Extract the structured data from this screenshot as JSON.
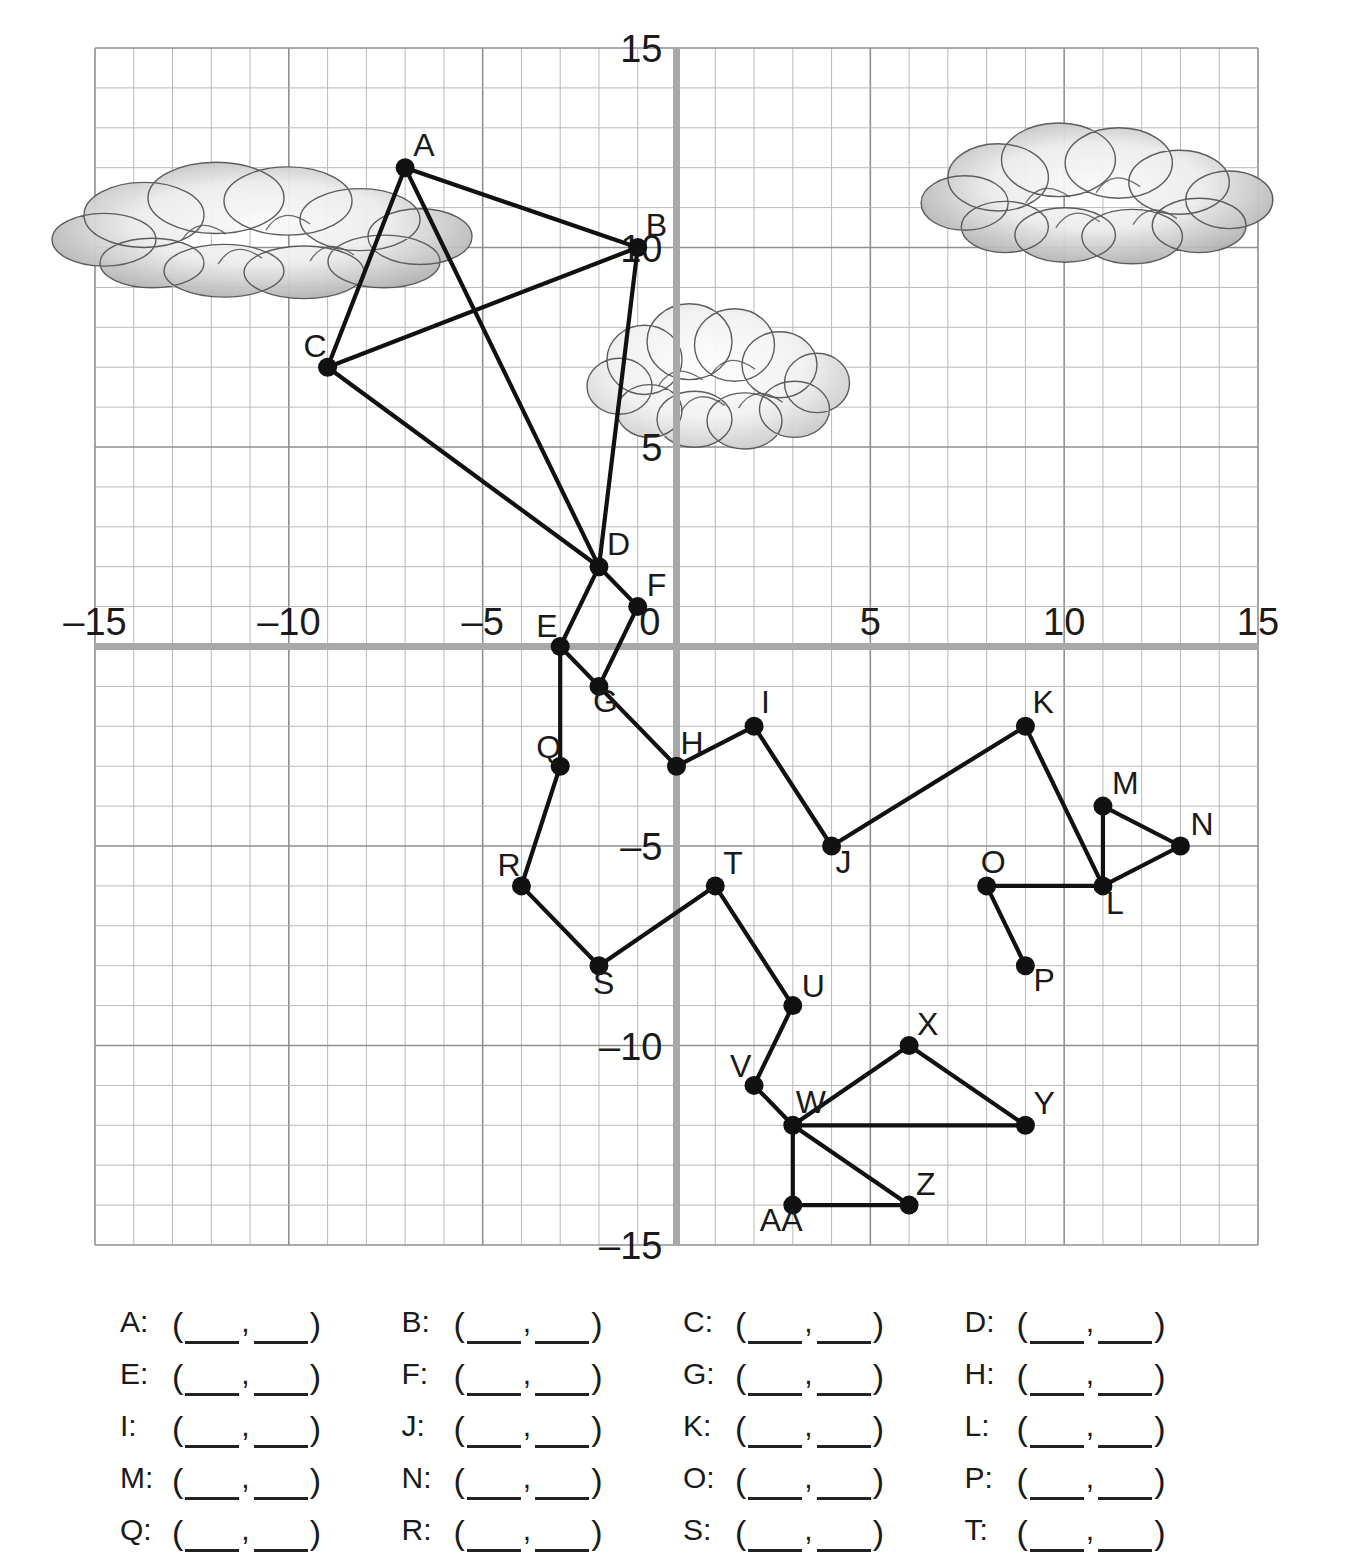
{
  "chart_data": {
    "type": "scatter",
    "title": "",
    "xlabel": "",
    "ylabel": "",
    "xlim": [
      -15,
      15
    ],
    "ylim": [
      -15,
      15
    ],
    "grid": true,
    "grid_step": 1,
    "major_step": 5,
    "x_ticks": [
      -15,
      -10,
      -5,
      0,
      5,
      10,
      15
    ],
    "y_ticks": [
      -15,
      -10,
      -5,
      5,
      10,
      15
    ],
    "x_tick_labels": [
      "–15",
      "–10",
      "–5",
      "0",
      "5",
      "10",
      "15"
    ],
    "y_tick_labels": [
      "–15",
      "–10",
      "–5",
      "5",
      "10",
      "15"
    ],
    "origin_label": "0",
    "points": [
      {
        "label": "A",
        "x": -7,
        "y": 12,
        "lx": 8,
        "ly": -12
      },
      {
        "label": "B",
        "x": -1,
        "y": 10,
        "lx": 8,
        "ly": -12
      },
      {
        "label": "C",
        "x": -9,
        "y": 7,
        "lx": -24,
        "ly": -10
      },
      {
        "label": "D",
        "x": -2,
        "y": 2,
        "lx": 8,
        "ly": -12
      },
      {
        "label": "E",
        "x": -3,
        "y": 0,
        "lx": -24,
        "ly": -10
      },
      {
        "label": "F",
        "x": -1,
        "y": 1,
        "lx": 9,
        "ly": -11
      },
      {
        "label": "G",
        "x": -2,
        "y": -1,
        "lx": -6,
        "ly": 26
      },
      {
        "label": "H",
        "x": 0,
        "y": -3,
        "lx": 4,
        "ly": -12
      },
      {
        "label": "I",
        "x": 2,
        "y": -2,
        "lx": 7,
        "ly": -13
      },
      {
        "label": "J",
        "x": 4,
        "y": -5,
        "lx": 4,
        "ly": 27
      },
      {
        "label": "K",
        "x": 9,
        "y": -2,
        "lx": 7,
        "ly": -13
      },
      {
        "label": "L",
        "x": 11,
        "y": -6,
        "lx": 3,
        "ly": 28
      },
      {
        "label": "M",
        "x": 11,
        "y": -4,
        "lx": 9,
        "ly": -12
      },
      {
        "label": "N",
        "x": 13,
        "y": -5,
        "lx": 10,
        "ly": -11
      },
      {
        "label": "O",
        "x": 8,
        "y": -6,
        "lx": -6,
        "ly": -13
      },
      {
        "label": "P",
        "x": 9,
        "y": -8,
        "lx": 8,
        "ly": 25
      },
      {
        "label": "Q",
        "x": -3,
        "y": -3,
        "lx": -24,
        "ly": -8
      },
      {
        "label": "R",
        "x": -4,
        "y": -6,
        "lx": -24,
        "ly": -10
      },
      {
        "label": "S",
        "x": -2,
        "y": -8,
        "lx": -6,
        "ly": 28
      },
      {
        "label": "T",
        "x": 1,
        "y": -6,
        "lx": 8,
        "ly": -12
      },
      {
        "label": "U",
        "x": 3,
        "y": -9,
        "lx": 9,
        "ly": -9
      },
      {
        "label": "V",
        "x": 2,
        "y": -11,
        "lx": -24,
        "ly": -8
      },
      {
        "label": "W",
        "x": 3,
        "y": -12,
        "lx": 3,
        "ly": -12
      },
      {
        "label": "X",
        "x": 6,
        "y": -10,
        "lx": 8,
        "ly": -11
      },
      {
        "label": "Y",
        "x": 9,
        "y": -12,
        "lx": 8,
        "ly": -11
      },
      {
        "label": "Z",
        "x": 6,
        "y": -14,
        "lx": 7,
        "ly": -10
      },
      {
        "label": "AA",
        "x": 3,
        "y": -14,
        "lx": -33,
        "ly": 26
      }
    ],
    "segments": [
      [
        "A",
        "B"
      ],
      [
        "A",
        "C"
      ],
      [
        "A",
        "D"
      ],
      [
        "B",
        "C"
      ],
      [
        "B",
        "D"
      ],
      [
        "C",
        "D"
      ],
      [
        "D",
        "E"
      ],
      [
        "D",
        "F"
      ],
      [
        "E",
        "G"
      ],
      [
        "E",
        "Q"
      ],
      [
        "F",
        "G"
      ],
      [
        "G",
        "H"
      ],
      [
        "H",
        "I"
      ],
      [
        "I",
        "J"
      ],
      [
        "J",
        "K"
      ],
      [
        "K",
        "L"
      ],
      [
        "L",
        "M"
      ],
      [
        "L",
        "N"
      ],
      [
        "L",
        "O"
      ],
      [
        "M",
        "N"
      ],
      [
        "O",
        "P"
      ],
      [
        "Q",
        "R"
      ],
      [
        "R",
        "S"
      ],
      [
        "S",
        "T"
      ],
      [
        "T",
        "U"
      ],
      [
        "U",
        "V"
      ],
      [
        "V",
        "W"
      ],
      [
        "W",
        "X"
      ],
      [
        "W",
        "Y"
      ],
      [
        "W",
        "Z"
      ],
      [
        "W",
        "AA"
      ],
      [
        "X",
        "Y"
      ],
      [
        "Z",
        "AA"
      ]
    ],
    "decorations": [
      {
        "kind": "cloud",
        "name": "cloud-left",
        "cx": 268,
        "cy": 232,
        "w": 400,
        "h": 155
      },
      {
        "kind": "cloud",
        "name": "cloud-middle",
        "cx": 722,
        "cy": 378,
        "w": 250,
        "h": 165
      },
      {
        "kind": "cloud",
        "name": "cloud-right",
        "cx": 1102,
        "cy": 195,
        "w": 335,
        "h": 160
      }
    ]
  },
  "answers": {
    "open_paren": "(",
    "close_paren": ")",
    "comma": ",",
    "colon": ":",
    "rows": [
      [
        "A",
        "B",
        "C",
        "D"
      ],
      [
        "E",
        "F",
        "G",
        "H"
      ],
      [
        "I",
        "J",
        "K",
        "L"
      ],
      [
        "M",
        "N",
        "O",
        "P"
      ],
      [
        "Q",
        "R",
        "S",
        "T"
      ]
    ],
    "blank_value": ""
  },
  "colors": {
    "grid_minor": "#b9b9b9",
    "grid_major": "#8f8f8f",
    "axis": "#a8a8a8",
    "point": "#111111",
    "segment": "#111111",
    "text": "#1a1a1a",
    "cloud_stroke": "#555555",
    "cloud_light": "#f4f4f4",
    "cloud_dark": "#9a9a9a"
  }
}
